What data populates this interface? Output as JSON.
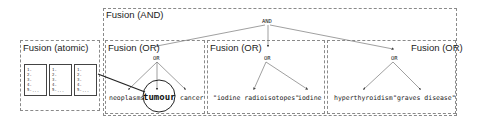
{
  "diagram": {
    "and_box": {
      "title": "Fusion (AND)",
      "operator": "AND"
    },
    "atomic_box": {
      "title": "Fusion (atomic)",
      "documents": [
        {
          "lines": [
            "1.",
            "2.",
            "3.",
            "4.",
            "5."
          ],
          "more": "..."
        },
        {
          "lines": [
            "1.",
            "2.",
            "3.",
            "4.",
            "5."
          ],
          "more": "..."
        },
        {
          "lines": [
            "1.",
            "2.",
            "3.",
            "4.",
            "5."
          ],
          "more": "..."
        }
      ]
    },
    "or_boxes": [
      {
        "title": "Fusion (OR)",
        "operator": "OR",
        "terms": [
          "neoplasms",
          "tumour",
          "cancer"
        ],
        "highlighted_term": "tumour"
      },
      {
        "title": "Fusion (OR)",
        "operator": "OR",
        "terms": [
          "\"iodine radioisotopes\"",
          "iodine"
        ]
      },
      {
        "title": "Fusion (OR)",
        "operator": "OR",
        "terms": [
          "hyperthyroidism",
          "\"graves disease\""
        ]
      }
    ],
    "colors": {
      "border": "#8a8a8a",
      "edge": "#777777",
      "text": "#222222"
    }
  }
}
